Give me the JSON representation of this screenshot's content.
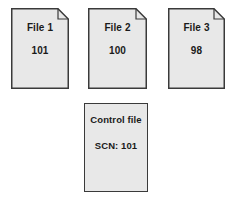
{
  "diagram": {
    "background_color": "#ffffff",
    "node_fill_color": "#e8e8e8",
    "node_border_color": "#3a3a3a",
    "text_color": "#1a1a1a"
  },
  "files": [
    {
      "id": "file-1",
      "label": "File 1",
      "value": "101",
      "shape": "document-clipped-corner"
    },
    {
      "id": "file-2",
      "label": "File 2",
      "value": "100",
      "shape": "document-clipped-corner"
    },
    {
      "id": "file-3",
      "label": "File 3",
      "value": "98",
      "shape": "document-clipped-corner"
    }
  ],
  "control_file": {
    "id": "control-file",
    "label": "Control file",
    "value": "SCN: 101",
    "shape": "rectangle"
  }
}
